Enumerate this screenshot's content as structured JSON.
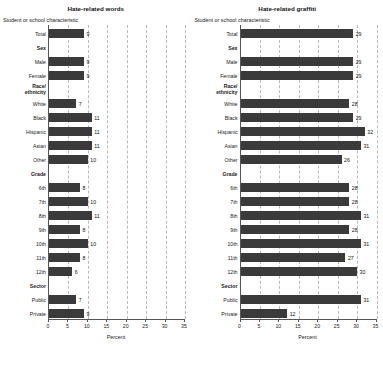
{
  "chart_data": [
    {
      "type": "bar",
      "title": "Hate-related words",
      "subtitle": "Student or school characteristic",
      "xlabel": "Percent",
      "ylabel": "",
      "orientation": "horizontal",
      "xlim": [
        0,
        35
      ],
      "xticks": [
        "0",
        "5",
        "10",
        "15",
        "20",
        "25",
        "30",
        "35"
      ],
      "grid": true,
      "legend": "none",
      "categories": [
        "Total",
        "Male",
        "Female",
        "White",
        "Black",
        "Hispanic",
        "Asian",
        "Other",
        "6th",
        "7th",
        "8th",
        "9th",
        "10th",
        "11th",
        "12th",
        "Public",
        "Private"
      ],
      "values": [
        9,
        9,
        9,
        7,
        11,
        11,
        11,
        10,
        8,
        10,
        11,
        8,
        10,
        8,
        6,
        7,
        9
      ],
      "group_headers": [
        "Sex",
        "Race/ethnicity",
        "Grade",
        "Sector"
      ]
    },
    {
      "type": "bar",
      "title": "Hate-related graffiti",
      "subtitle": "Student or school characteristic",
      "xlabel": "Percent",
      "ylabel": "",
      "orientation": "horizontal",
      "xlim": [
        0,
        35
      ],
      "xticks": [
        "0",
        "5",
        "10",
        "15",
        "20",
        "25",
        "30",
        "35"
      ],
      "grid": true,
      "legend": "none",
      "categories": [
        "Total",
        "Male",
        "Female",
        "White",
        "Black",
        "Hispanic",
        "Asian",
        "Other",
        "6th",
        "7th",
        "8th",
        "9th",
        "10th",
        "11th",
        "12th",
        "Public",
        "Private"
      ],
      "values": [
        29,
        29,
        29,
        28,
        29,
        32,
        31,
        26,
        28,
        28,
        31,
        28,
        31,
        27,
        30,
        31,
        12
      ],
      "group_headers": [
        "Sex",
        "Race/ethnicity",
        "Grade",
        "Sector"
      ]
    }
  ],
  "panels": [
    {
      "title": "Hate-related words",
      "subtitle": "Student or school characteristic",
      "xlabel": "Percent",
      "xticks": [
        "0",
        "5",
        "10",
        "15",
        "20",
        "25",
        "30",
        "35"
      ],
      "rows": [
        {
          "label": "Total",
          "value": 9,
          "type": "bar"
        },
        {
          "label": "Sex",
          "type": "group"
        },
        {
          "label": "Male",
          "value": 9,
          "type": "bar"
        },
        {
          "label": "Female",
          "value": 9,
          "type": "bar"
        },
        {
          "label": "Race/\nethnicity",
          "type": "group2"
        },
        {
          "label": "White",
          "value": 7,
          "type": "bar"
        },
        {
          "label": "Black",
          "value": 11,
          "type": "bar"
        },
        {
          "label": "Hispanic",
          "value": 11,
          "type": "bar"
        },
        {
          "label": "Asian",
          "value": 11,
          "type": "bar"
        },
        {
          "label": "Other",
          "value": 10,
          "type": "bar"
        },
        {
          "label": "Grade",
          "type": "group"
        },
        {
          "label": "6th",
          "value": 8,
          "type": "bar"
        },
        {
          "label": "7th",
          "value": 10,
          "type": "bar"
        },
        {
          "label": "8th",
          "value": 11,
          "type": "bar"
        },
        {
          "label": "9th",
          "value": 8,
          "type": "bar"
        },
        {
          "label": "10th",
          "value": 10,
          "type": "bar"
        },
        {
          "label": "11th",
          "value": 8,
          "type": "bar"
        },
        {
          "label": "12th",
          "value": 6,
          "type": "bar"
        },
        {
          "label": "Sector",
          "type": "group"
        },
        {
          "label": "Public",
          "value": 7,
          "type": "bar"
        },
        {
          "label": "Private",
          "value": 9,
          "type": "bar"
        }
      ]
    },
    {
      "title": "Hate-related graffiti",
      "subtitle": "Student or school characteristic",
      "xlabel": "Percent",
      "xticks": [
        "0",
        "5",
        "10",
        "15",
        "20",
        "25",
        "30",
        "35"
      ],
      "rows": [
        {
          "label": "Total",
          "value": 29,
          "type": "bar"
        },
        {
          "label": "Sex",
          "type": "group"
        },
        {
          "label": "Male",
          "value": 29,
          "type": "bar"
        },
        {
          "label": "Female",
          "value": 29,
          "type": "bar"
        },
        {
          "label": "Race/\nethnicity",
          "type": "group2"
        },
        {
          "label": "White",
          "value": 28,
          "type": "bar"
        },
        {
          "label": "Black",
          "value": 29,
          "type": "bar"
        },
        {
          "label": "Hispanic",
          "value": 32,
          "type": "bar"
        },
        {
          "label": "Asian",
          "value": 31,
          "type": "bar"
        },
        {
          "label": "Other",
          "value": 26,
          "type": "bar"
        },
        {
          "label": "Grade",
          "type": "group"
        },
        {
          "label": "6th",
          "value": 28,
          "type": "bar"
        },
        {
          "label": "7th",
          "value": 28,
          "type": "bar"
        },
        {
          "label": "8th",
          "value": 31,
          "type": "bar"
        },
        {
          "label": "9th",
          "value": 28,
          "type": "bar"
        },
        {
          "label": "10th",
          "value": 31,
          "type": "bar"
        },
        {
          "label": "11th",
          "value": 27,
          "type": "bar"
        },
        {
          "label": "12th",
          "value": 30,
          "type": "bar"
        },
        {
          "label": "Sector",
          "type": "group"
        },
        {
          "label": "Public",
          "value": 31,
          "type": "bar"
        },
        {
          "label": "Private",
          "value": 12,
          "type": "bar"
        }
      ]
    }
  ],
  "colors": {
    "bar": "#3a3a3a",
    "grid": "#b9b9b9",
    "axis": "#555555",
    "text": "#1a1a1a",
    "background": "#ffffff"
  }
}
